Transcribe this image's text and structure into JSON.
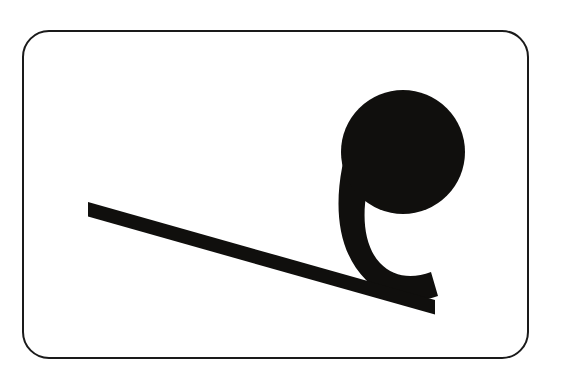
{
  "image": {
    "title": "Inclined plane with ball pictogram",
    "width": 563,
    "height": 389,
    "background_color": "#ffffff",
    "style": "monochrome line-art pictogram",
    "caption_text": ""
  },
  "frame": {
    "name": "rounded-rectangle-border",
    "stroke_color": "#1a1a1a",
    "fill_color": "#ffffff",
    "stroke_width": 2,
    "corner_radius": 26,
    "x": 23,
    "y": 31,
    "width": 505,
    "height": 327
  },
  "shapes": {
    "fill_color": "#100f0d",
    "ball": {
      "name": "ball-circle",
      "label": "Ball",
      "center_x": 403,
      "center_y": 152,
      "radius": 62
    },
    "tail": {
      "name": "ball-tail-curve",
      "label": "Tail stroke",
      "description": "thick comma-like stroke curving from ball down-left then right to meet the ramp",
      "path": "M 348 140 C 332 195, 334 250, 368 281 C 392 303, 418 301, 436 295 L 430 272 C 410 277, 392 276, 380 264 C 362 246, 362 205, 372 175 Z"
    },
    "ramp": {
      "name": "inclined-ramp-bar",
      "label": "Inclined plane",
      "description": "long thin diagonal bar sloping down from upper left to lower right",
      "start_x": 88,
      "start_y": 202,
      "end_x": 435,
      "end_y": 300,
      "thickness": 14,
      "path": "M 88 202 L 88 216 L 435 301 L 435 287 Z"
    }
  },
  "colors": {
    "ink": "#100f0d",
    "border": "#1a1a1a",
    "paper": "#ffffff"
  }
}
